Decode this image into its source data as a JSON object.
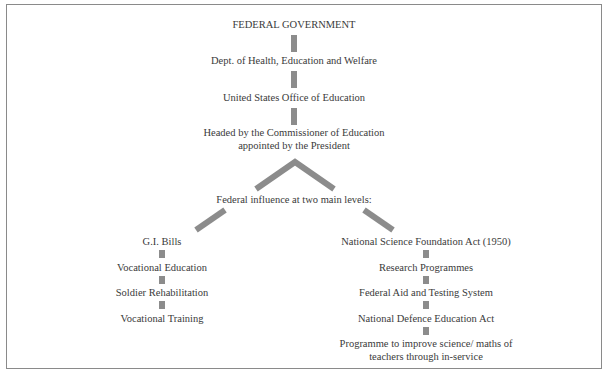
{
  "diagram": {
    "title": "FEDERAL GOVERNMENT",
    "chain": [
      "Dept. of Health, Education and Welfare",
      "United States Office of Education",
      "Headed by the Commissioner of Education",
      "appointed by the President"
    ],
    "split_label": "Federal influence at two main levels:",
    "left_branch": [
      "G.I. Bills",
      "Vocational Education",
      "Soldier Rehabilitation",
      "Vocational Training"
    ],
    "right_branch": [
      "National Science Foundation Act (1950)",
      "Research Programmes",
      "Federal Aid and Testing System",
      "National Defence Education Act",
      "Programme to improve science/ maths of",
      "teachers through in-service"
    ],
    "colors": {
      "connector": "#8c8c8c",
      "border": "#8a8a8a",
      "text": "#3a3a3a"
    }
  }
}
